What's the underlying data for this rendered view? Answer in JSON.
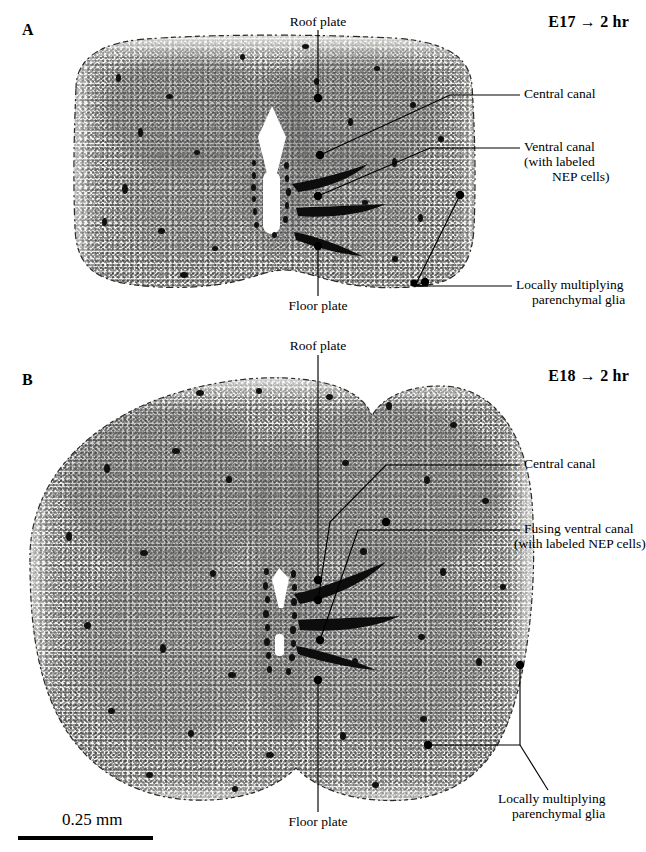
{
  "figure": {
    "scale_bar": {
      "label": "0.25 mm",
      "length_px": 135
    }
  },
  "panels": [
    {
      "letter": "A",
      "header": "E17 → 2 hr",
      "labels": {
        "roof_plate": "Roof plate",
        "floor_plate": "Floor plate",
        "central_canal": "Central canal",
        "ventral_canal_line1": "Ventral canal",
        "ventral_canal_line2": "(with labeled",
        "ventral_canal_line3": "NEP cells)",
        "glia_line1": "Locally multiplying",
        "glia_line2": "parenchymal glia"
      }
    },
    {
      "letter": "B",
      "header": "E18 → 2 hr",
      "labels": {
        "roof_plate": "Roof plate",
        "floor_plate": "Floor plate",
        "central_canal": "Central canal",
        "fusing_ventral_canal_line1": "Fusing ventral canal",
        "fusing_ventral_canal_line2": "(with labeled NEP cells)",
        "glia_line1": "Locally multiplying",
        "glia_line2": "parenchymal glia"
      }
    }
  ],
  "colors": {
    "ink": "#000000",
    "tissue_pale": "#f4f4f2",
    "tissue_gray": "#5a5a5a",
    "lumen": "#ffffff"
  }
}
